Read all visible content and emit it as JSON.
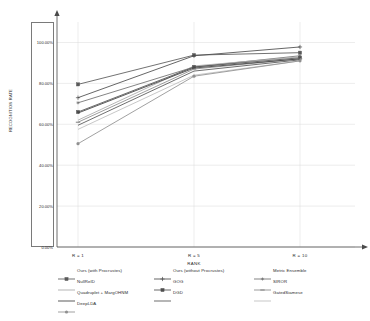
{
  "chart_data": {
    "type": "line",
    "title": "",
    "xlabel": "RANK",
    "ylabel": "RECOGNITION RATE",
    "x": [
      1,
      5,
      10
    ],
    "categories": [
      "R = 1",
      "R = 5",
      "R = 10"
    ],
    "ytick_labels": [
      "0.00%",
      "20.00%",
      "40.00%",
      "60.00%",
      "80.00%",
      "100.00%"
    ],
    "ytick_values": [
      0,
      20,
      40,
      60,
      80,
      100
    ],
    "ylim": [
      0,
      110
    ],
    "grid": true,
    "legend_position": "bottom",
    "series": [
      {
        "name": "Ours (with Procrustes)",
        "values": [
          79.5,
          93.8,
          95.0
        ],
        "color": "#595959",
        "marker": "square"
      },
      {
        "name": "Ours (without Procrustes)",
        "values": [
          73.0,
          93.5,
          97.8
        ],
        "color": "#4a4a4a",
        "marker": "plus"
      },
      {
        "name": "Metric Ensemble",
        "values": [
          70.5,
          88.0,
          93.5
        ],
        "color": "#6e6e6e",
        "marker": "star"
      },
      {
        "name": "NullReID",
        "values": [
          62.0,
          88.5,
          93.0
        ],
        "color": "#a8a8a8",
        "marker": "none"
      },
      {
        "name": "GOG",
        "values": [
          66.0,
          88.0,
          92.5
        ],
        "color": "#4f4f4f",
        "marker": "square"
      },
      {
        "name": "SIROR",
        "values": [
          61.0,
          87.0,
          92.0
        ],
        "color": "#8a8a8a",
        "marker": "dash"
      },
      {
        "name": "Quadruplet + MargOHNM",
        "values": [
          65.5,
          87.5,
          92.0
        ],
        "color": "#3f3f3f",
        "marker": "none"
      },
      {
        "name": "DGD",
        "values": [
          59.5,
          86.0,
          91.5
        ],
        "color": "#545454",
        "marker": "none"
      },
      {
        "name": "GatedSiamese",
        "values": [
          57.5,
          84.0,
          91.0
        ],
        "color": "#bdbdbd",
        "marker": "none"
      },
      {
        "name": "DeepLDA",
        "values": [
          50.5,
          83.5,
          91.0
        ],
        "color": "#909090",
        "marker": "circle"
      }
    ]
  }
}
